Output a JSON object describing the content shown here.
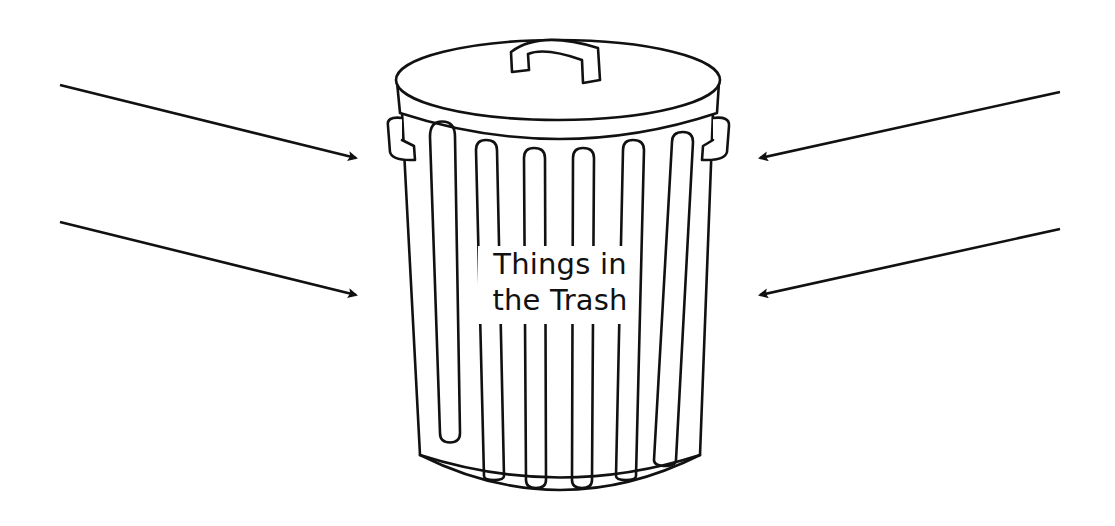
{
  "diagram": {
    "title_line1": "Things in",
    "title_line2": "the Trash",
    "center_object": "trash-can",
    "stroke_color": "#111111",
    "background_color": "#ffffff",
    "arrows": [
      {
        "id": "top-left",
        "from": [
          60,
          85
        ],
        "to": [
          358,
          158
        ],
        "direction": "right"
      },
      {
        "id": "bottom-left",
        "from": [
          60,
          222
        ],
        "to": [
          358,
          295
        ],
        "direction": "right"
      },
      {
        "id": "top-right",
        "from": [
          1060,
          92
        ],
        "to": [
          758,
          158
        ],
        "direction": "left"
      },
      {
        "id": "bottom-right",
        "from": [
          1060,
          229
        ],
        "to": [
          758,
          295
        ],
        "direction": "left"
      }
    ]
  }
}
